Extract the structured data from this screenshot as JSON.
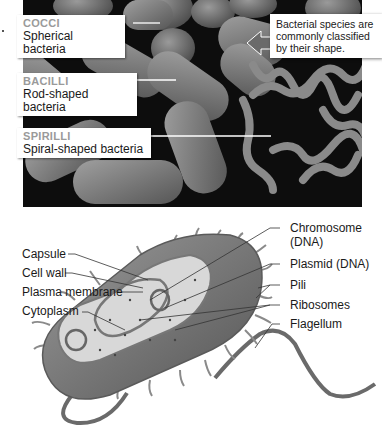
{
  "photo": {
    "description": "Micrograph of bacteria shapes",
    "labels": [
      {
        "heading": "COCCI",
        "sub": "Spherical bacteria"
      },
      {
        "heading": "BACILLI",
        "sub": "Rod-shaped bacteria"
      },
      {
        "heading": "SPIRILLI",
        "sub": "Spiral-shaped bacteria"
      }
    ],
    "callout": "Bacterial species are commonly classified by their shape."
  },
  "diagram": {
    "left_labels": [
      "Capsule",
      "Cell wall",
      "Plasma membrane",
      "Cytoplasm"
    ],
    "right_labels": [
      "Chromosome (DNA)",
      "Plasmid (DNA)",
      "Pili",
      "Ribosomes",
      "Flagellum"
    ],
    "right_label_lines": {
      "chromosome_line1": "Chromosome",
      "chromosome_line2": "(DNA)"
    }
  },
  "colors": {
    "photo_bg": "#0d0d0d",
    "label_heading": "#9a9a9a",
    "text": "#1a1a1a",
    "cell_gray": "#8a8a8a"
  }
}
